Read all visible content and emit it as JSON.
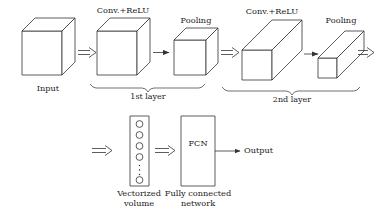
{
  "figure": {
    "background_color": "#ffffff",
    "stroke_color": "#333333",
    "text_color": "#1a1a1a"
  },
  "top_row": {
    "input": {
      "label": "Input",
      "shape": "cube",
      "icon": "cube-icon"
    },
    "stages": [
      {
        "label": "Conv.+ReLU",
        "shape": "cube",
        "icon": "cube-icon"
      },
      {
        "label": "Pooling",
        "shape": "cube",
        "icon": "cube-icon"
      },
      {
        "label": "Conv.+ReLU",
        "shape": "long-box",
        "icon": "long-box-icon"
      },
      {
        "label": "Pooling",
        "shape": "long-box",
        "icon": "long-box-icon"
      }
    ],
    "braces": [
      {
        "label": "1st layer"
      },
      {
        "label": "2nd layer"
      }
    ],
    "arrows": [
      {
        "type": "double-arrow",
        "icon": "double-arrow-icon"
      },
      {
        "type": "single-arrow",
        "icon": "single-arrow-icon"
      },
      {
        "type": "double-arrow",
        "icon": "double-arrow-icon"
      },
      {
        "type": "single-arrow",
        "icon": "single-arrow-icon"
      },
      {
        "type": "double-arrow",
        "icon": "double-arrow-icon"
      }
    ]
  },
  "bottom_row": {
    "vectorized": {
      "label_line1": "Vectorized",
      "label_line2": "volume",
      "icon": "vector-column-icon",
      "circles_top": 5,
      "ellipsis_dots": 3,
      "circles_bottom": 1
    },
    "fcn": {
      "box_label": "FCN",
      "label_line1": "Fully connected",
      "label_line2": "network",
      "icon": "fcn-box-icon"
    },
    "output": {
      "label": "Output",
      "icon": "single-arrow-icon"
    },
    "arrows": [
      {
        "type": "double-arrow",
        "icon": "double-arrow-icon"
      },
      {
        "type": "double-arrow",
        "icon": "double-arrow-icon"
      }
    ]
  }
}
